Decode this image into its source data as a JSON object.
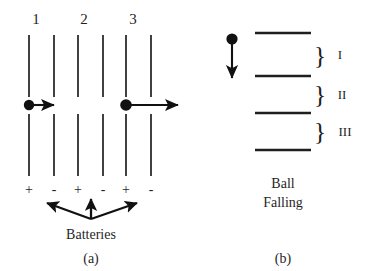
{
  "figure": {
    "title_a": "(a)",
    "title_b": "(b)",
    "panel_a": {
      "capacitor_labels": [
        "1",
        "2",
        "3"
      ],
      "plate_signs": {
        "positive": "+",
        "negative": "-"
      },
      "capacitors": [
        {
          "label": "1",
          "plus": "+",
          "minus": "-"
        },
        {
          "label": "2",
          "plus": "+",
          "minus": "-"
        },
        {
          "label": "3",
          "plus": "+",
          "minus": "-"
        }
      ],
      "batteries_label": "Batteries",
      "ball_icon": "charged-ball-icon",
      "velocity_arrow_icon": "velocity-arrow-icon",
      "caption": "(a)"
    },
    "panel_b": {
      "ball_icon": "falling-ball-icon",
      "fall_arrow_icon": "downward-arrow-icon",
      "regions": [
        {
          "numeral": "I",
          "brace": "}"
        },
        {
          "numeral": "II",
          "brace": "}"
        },
        {
          "numeral": "III",
          "brace": "}"
        }
      ],
      "caption_lines": [
        "Ball",
        "Falling"
      ],
      "caption": "(b)"
    },
    "colors": {
      "ink": "#1f1f1f",
      "background": "#ffffff"
    }
  }
}
